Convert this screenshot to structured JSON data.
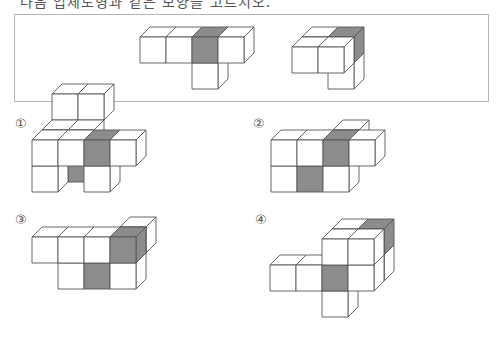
{
  "title": "다음 입체도형과 같은 모양을 고르시오.",
  "colors": {
    "line": "#555555",
    "face": "#ffffff",
    "shade": "#8c8c8c",
    "box_border": "#b5b5b5"
  },
  "cube": {
    "size": 26,
    "dx": 10,
    "dy": -10
  },
  "given": [
    {
      "name": "given-figure-front-view",
      "origin": [
        140,
        37
      ],
      "cubes": [
        {
          "c": 0,
          "r": 0,
          "d": 0
        },
        {
          "c": 1,
          "r": 0,
          "d": 0
        },
        {
          "c": 2,
          "r": 0,
          "d": 0,
          "shade": [
            "front",
            "top"
          ]
        },
        {
          "c": 3,
          "r": 0,
          "d": 0
        },
        {
          "c": 2,
          "r": 1,
          "d": 0
        }
      ]
    },
    {
      "name": "given-figure-rotated-view",
      "origin": [
        292,
        47
      ],
      "cubes": [
        {
          "c": 1,
          "r": 1,
          "d": 1
        },
        {
          "c": 0,
          "r": 0,
          "d": 1
        },
        {
          "c": 1,
          "r": 0,
          "d": 1,
          "shade": [
            "top",
            "right"
          ]
        },
        {
          "c": 0,
          "r": 0,
          "d": 0
        },
        {
          "c": 1,
          "r": 0,
          "d": 0
        }
      ]
    }
  ],
  "options": [
    {
      "label": "①",
      "label_pos": [
        15,
        116
      ],
      "origin": [
        32,
        140
      ],
      "cubes": [
        {
          "c": 0,
          "r": -1,
          "d": 2
        },
        {
          "c": 1,
          "r": -1,
          "d": 2
        },
        {
          "c": 1,
          "r": 1,
          "d": 1,
          "shade": [
            "front"
          ]
        },
        {
          "c": 0,
          "r": 0,
          "d": 1
        },
        {
          "c": 1,
          "r": 0,
          "d": 1
        },
        {
          "c": 0,
          "r": 1,
          "d": 0
        },
        {
          "c": 2,
          "r": 1,
          "d": 0
        },
        {
          "c": 0,
          "r": 0,
          "d": 0
        },
        {
          "c": 1,
          "r": 0,
          "d": 0
        },
        {
          "c": 2,
          "r": 0,
          "d": 0,
          "shade": [
            "front",
            "top"
          ]
        },
        {
          "c": 3,
          "r": 0,
          "d": 0
        }
      ]
    },
    {
      "label": "②",
      "label_pos": [
        253,
        116
      ],
      "origin": [
        271,
        140
      ],
      "cubes": [
        {
          "c": 2,
          "r": 0,
          "d": 1
        },
        {
          "c": 0,
          "r": 1,
          "d": 0
        },
        {
          "c": 1,
          "r": 1,
          "d": 0,
          "shade": [
            "front"
          ]
        },
        {
          "c": 2,
          "r": 1,
          "d": 0
        },
        {
          "c": 0,
          "r": 0,
          "d": 0
        },
        {
          "c": 1,
          "r": 0,
          "d": 0
        },
        {
          "c": 2,
          "r": 0,
          "d": 0,
          "shade": [
            "front",
            "top"
          ]
        },
        {
          "c": 3,
          "r": 0,
          "d": 0
        }
      ]
    },
    {
      "label": "③",
      "label_pos": [
        15,
        212
      ],
      "origin": [
        32,
        237
      ],
      "cubes": [
        {
          "c": 3,
          "r": 0,
          "d": 1
        },
        {
          "c": 1,
          "r": 1,
          "d": 0
        },
        {
          "c": 2,
          "r": 1,
          "d": 0,
          "shade": [
            "front"
          ]
        },
        {
          "c": 3,
          "r": 1,
          "d": 0
        },
        {
          "c": 0,
          "r": 0,
          "d": 0
        },
        {
          "c": 1,
          "r": 0,
          "d": 0
        },
        {
          "c": 2,
          "r": 0,
          "d": 0
        },
        {
          "c": 3,
          "r": 0,
          "d": 0,
          "shade": [
            "front",
            "top",
            "right"
          ]
        }
      ]
    },
    {
      "label": "④",
      "label_pos": [
        255,
        212
      ],
      "origin": [
        270,
        265
      ],
      "cubes": [
        {
          "c": 2,
          "r": -1,
          "d": 1
        },
        {
          "c": 3,
          "r": -1,
          "d": 1,
          "shade": [
            "top",
            "right"
          ]
        },
        {
          "c": 3,
          "r": 0,
          "d": 1
        },
        {
          "c": 2,
          "r": 1,
          "d": 0
        },
        {
          "c": 0,
          "r": 0,
          "d": 0
        },
        {
          "c": 1,
          "r": 0,
          "d": 0
        },
        {
          "c": 2,
          "r": 0,
          "d": 0,
          "shade": [
            "front"
          ]
        },
        {
          "c": 3,
          "r": 0,
          "d": 0
        },
        {
          "c": 2,
          "r": -1,
          "d": 0
        },
        {
          "c": 3,
          "r": -1,
          "d": 0
        }
      ]
    }
  ]
}
